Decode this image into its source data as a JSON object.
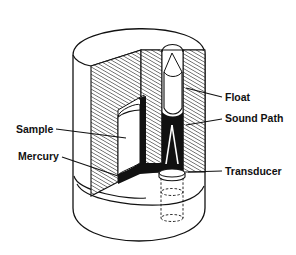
{
  "diagram": {
    "type": "cutaway",
    "colors": {
      "line": "#111111",
      "fill_dark": "#111111",
      "background": "#ffffff"
    },
    "labels": [
      {
        "id": "float",
        "text": "Float"
      },
      {
        "id": "sound_path",
        "text": "Sound Path"
      },
      {
        "id": "sample",
        "text": "Sample"
      },
      {
        "id": "mercury",
        "text": "Mercury"
      },
      {
        "id": "transducer",
        "text": "Transducer"
      }
    ]
  }
}
